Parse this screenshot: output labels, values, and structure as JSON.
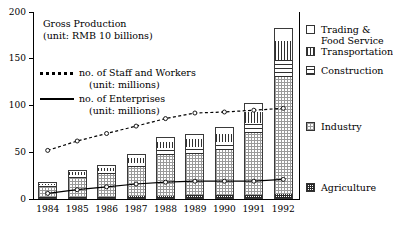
{
  "chart_data": {
    "type": "bar",
    "title": "",
    "xlabel": "",
    "ylabel": "",
    "ylim": [
      0,
      200
    ],
    "yticks": [
      0,
      50,
      100,
      150,
      200
    ],
    "grid": false,
    "legend_position": "right",
    "categories": [
      "1984",
      "1985",
      "1986",
      "1987",
      "1988",
      "1989",
      "1990",
      "1991",
      "1992"
    ],
    "series": [
      {
        "name": "Agriculture",
        "pattern": "dense-grid",
        "values": [
          2.0,
          2.4,
          2.6,
          3.0,
          3.6,
          3.8,
          4.0,
          4.6,
          5.5
        ]
      },
      {
        "name": "Industry",
        "pattern": "light-dot",
        "values": [
          11.0,
          20.0,
          24.0,
          31.0,
          44.0,
          44.0,
          48.0,
          66.0,
          125.0
        ]
      },
      {
        "name": "Construction",
        "pattern": "horizontal-stripes",
        "values": [
          2.0,
          3.0,
          3.5,
          5.0,
          7.0,
          8.0,
          9.0,
          11.0,
          18.0
        ]
      },
      {
        "name": "Transportation",
        "pattern": "vertical-stripes",
        "values": [
          1.5,
          3.0,
          3.5,
          5.0,
          6.5,
          8.0,
          9.0,
          12.0,
          20.0
        ]
      },
      {
        "name": "Trading & Food Service",
        "pattern": "solid-white",
        "values": [
          2.0,
          2.5,
          3.0,
          4.0,
          5.0,
          6.0,
          7.0,
          9.0,
          14.0
        ]
      }
    ],
    "totals": [
      18.5,
      30.9,
      36.6,
      48.0,
      66.1,
      69.8,
      77.0,
      102.6,
      182.5
    ],
    "lines": [
      {
        "name": "no. of Staff and Workers",
        "unit": "millions",
        "style": "dotted",
        "marker": "open-circle",
        "values": [
          52,
          62,
          70,
          78,
          86,
          92,
          93,
          95,
          97
        ]
      },
      {
        "name": "no. of Enterprises",
        "unit": "millions",
        "style": "solid",
        "marker": "open-circle",
        "values": [
          6,
          10,
          13,
          16,
          18,
          19,
          19,
          19,
          21
        ]
      }
    ]
  },
  "annotations": {
    "gross_production_line1": "Gross Production",
    "gross_production_line2": "(unit: RMB 10 billions)",
    "staff_label": "no. of Staff and Workers",
    "staff_unit": "(unit: millions)",
    "enterprises_label": "no. of Enterprises",
    "enterprises_unit": "(unit: millions)"
  },
  "legend": {
    "top_group": [
      {
        "label_line1": "Trading &",
        "label_line2": "Food Service",
        "swatch": "solid-white"
      },
      {
        "label_line1": "Transportation",
        "label_line2": "",
        "swatch": "vertical-stripes"
      },
      {
        "label_line1": "Construction",
        "label_line2": "",
        "swatch": "horizontal-stripes"
      }
    ],
    "industry": {
      "label": "Industry",
      "swatch": "light-dot"
    },
    "agriculture": {
      "label": "Agriculture",
      "swatch": "dense-grid"
    }
  }
}
